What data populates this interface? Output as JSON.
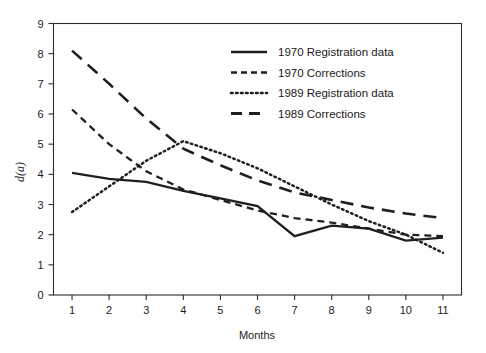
{
  "chart_data": {
    "type": "line",
    "title": "",
    "subtitle": "",
    "xlabel": "Months",
    "ylabel": "d(a)",
    "xlim": [
      0.5,
      11.5
    ],
    "ylim": [
      0,
      9
    ],
    "xticks": [
      "1",
      "2",
      "3",
      "4",
      "5",
      "6",
      "7",
      "8",
      "9",
      "10",
      "11"
    ],
    "yticks": [
      "0",
      "1",
      "2",
      "3",
      "4",
      "5",
      "6",
      "7",
      "8",
      "9"
    ],
    "grid": false,
    "legend_position": "top-right",
    "x": [
      1,
      2,
      3,
      4,
      5,
      6,
      7,
      8,
      9,
      10,
      11
    ],
    "series": [
      {
        "name": "1970 Registration data",
        "style": "solid",
        "values": [
          4.05,
          3.85,
          3.75,
          3.45,
          3.2,
          2.95,
          1.95,
          2.3,
          2.2,
          1.8,
          1.9
        ]
      },
      {
        "name": "1970 Corrections",
        "style": "dashed",
        "values": [
          6.15,
          5.0,
          4.1,
          3.5,
          3.15,
          2.8,
          2.55,
          2.4,
          2.2,
          2.0,
          1.95
        ]
      },
      {
        "name": "1989 Registration data",
        "style": "dotted",
        "values": [
          2.75,
          3.6,
          4.45,
          5.1,
          4.7,
          4.2,
          3.6,
          3.0,
          2.45,
          2.0,
          1.4
        ]
      },
      {
        "name": "1989 Corrections",
        "style": "long-dashed",
        "values": [
          8.1,
          7.0,
          5.85,
          4.85,
          4.3,
          3.8,
          3.4,
          3.15,
          2.9,
          2.7,
          2.55
        ]
      }
    ]
  },
  "legend": {
    "entries": [
      {
        "label": "1970 Registration data",
        "style": "solid"
      },
      {
        "label": "1970 Corrections",
        "style": "dashed"
      },
      {
        "label": "1989 Registration data",
        "style": "dotted"
      },
      {
        "label": "1989 Corrections",
        "style": "long-dashed"
      }
    ]
  },
  "axes": {
    "x_title": "Months",
    "y_title": "d(a)"
  }
}
